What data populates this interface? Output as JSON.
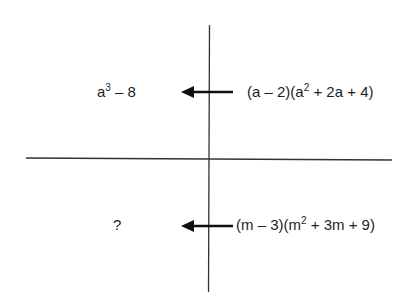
{
  "diagram": {
    "type": "quadrant-chart",
    "quadrants": {
      "top_left": {
        "base": "a",
        "exp": "3",
        "rest": " – 8"
      },
      "top_right": {
        "p1": "(a – 2)(a",
        "exp": "2",
        "p2": " + 2a + 4)"
      },
      "bottom_left": {
        "text": "?"
      },
      "bottom_right": {
        "p1": "(m – 3)(m",
        "exp": "2",
        "p2": " + 3m + 9)"
      }
    },
    "arrows": [
      {
        "direction": "left",
        "from": "top_right",
        "to": "top_left"
      },
      {
        "direction": "left",
        "from": "bottom_right",
        "to": "bottom_left"
      }
    ],
    "colors": {
      "line": "#333333",
      "arrow": "#111111",
      "text": "#1e1e1e",
      "background": "#ffffff"
    }
  }
}
